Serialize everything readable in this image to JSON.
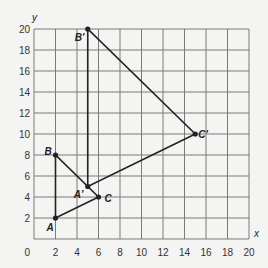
{
  "chart_data": {
    "type": "scatter",
    "title": "",
    "xlabel": "x",
    "ylabel": "y",
    "xlim": [
      0,
      20
    ],
    "ylim": [
      0,
      20
    ],
    "grid": true,
    "x_ticks": [
      "0",
      "2",
      "4",
      "6",
      "8",
      "10",
      "12",
      "14",
      "16",
      "18",
      "20"
    ],
    "y_ticks": [
      "2",
      "4",
      "6",
      "8",
      "10",
      "12",
      "14",
      "16",
      "18",
      "20"
    ],
    "origin_label": "0",
    "series": [
      {
        "name": "Triangle ABC",
        "points": [
          {
            "label": "A",
            "x": 2,
            "y": 2
          },
          {
            "label": "B",
            "x": 2,
            "y": 8
          },
          {
            "label": "C",
            "x": 6,
            "y": 4
          }
        ]
      },
      {
        "name": "Triangle A'B'C'",
        "points": [
          {
            "label": "A'",
            "x": 5,
            "y": 5
          },
          {
            "label": "B'",
            "x": 5,
            "y": 20
          },
          {
            "label": "C'",
            "x": 15,
            "y": 10
          }
        ]
      }
    ]
  },
  "colors": {
    "grid": "#7a7a7a",
    "line": "#222222",
    "background": "#f4f4f2"
  }
}
